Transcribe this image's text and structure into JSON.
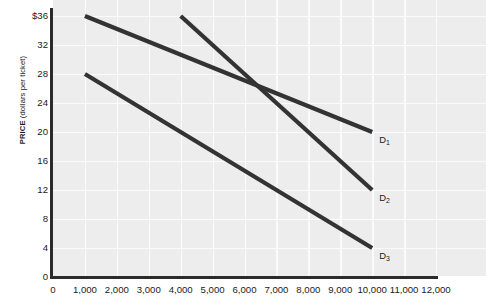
{
  "chart_data": {
    "type": "line",
    "title": "",
    "xlabel": "",
    "ylabel": "PRICE (dollars per ticket)",
    "ylabel_bold_part": "PRICE",
    "ylabel_rest": " (dollars per ticket)",
    "xlim": [
      0,
      12600
    ],
    "ylim": [
      0,
      38
    ],
    "grid": true,
    "legend_position": "inline-right",
    "x_ticks": [
      {
        "value": 0,
        "label": "0"
      },
      {
        "value": 1000,
        "label": "1,000"
      },
      {
        "value": 2000,
        "label": "2,000"
      },
      {
        "value": 3000,
        "label": "3,000"
      },
      {
        "value": 4000,
        "label": "4,000"
      },
      {
        "value": 5000,
        "label": "5,000"
      },
      {
        "value": 6000,
        "label": "6,000"
      },
      {
        "value": 7000,
        "label": "7,000"
      },
      {
        "value": 8000,
        "label": "8,000"
      },
      {
        "value": 9000,
        "label": "9,000"
      },
      {
        "value": 10000,
        "label": "10,000"
      },
      {
        "value": 11000,
        "label": "11,000"
      },
      {
        "value": 12000,
        "label": "12,000"
      }
    ],
    "y_ticks": [
      {
        "value": 36,
        "label": "$36"
      },
      {
        "value": 32,
        "label": "32"
      },
      {
        "value": 28,
        "label": "28"
      },
      {
        "value": 24,
        "label": "24"
      },
      {
        "value": 20,
        "label": "20"
      },
      {
        "value": 16,
        "label": "16"
      },
      {
        "value": 12,
        "label": "12"
      },
      {
        "value": 8,
        "label": "8"
      },
      {
        "value": 4,
        "label": "4"
      },
      {
        "value": 0,
        "label": "0"
      }
    ],
    "series": [
      {
        "name": "D1",
        "label": "D",
        "subscript": "1",
        "points": [
          [
            1000,
            36
          ],
          [
            10000,
            20
          ]
        ],
        "color": "#333333"
      },
      {
        "name": "D2",
        "label": "D",
        "subscript": "2",
        "points": [
          [
            4000,
            36
          ],
          [
            10000,
            12
          ]
        ],
        "color": "#333333"
      },
      {
        "name": "D3",
        "label": "D",
        "subscript": "3",
        "points": [
          [
            1000,
            28
          ],
          [
            10000,
            4
          ]
        ],
        "color": "#333333"
      }
    ],
    "colors": {
      "plot_background": "#ededed",
      "gridline": "#fbfbfb",
      "axis": "#2b2b2b",
      "curve": "#333333",
      "text": "#1b1b1b",
      "page_background": "#ffffff"
    }
  }
}
